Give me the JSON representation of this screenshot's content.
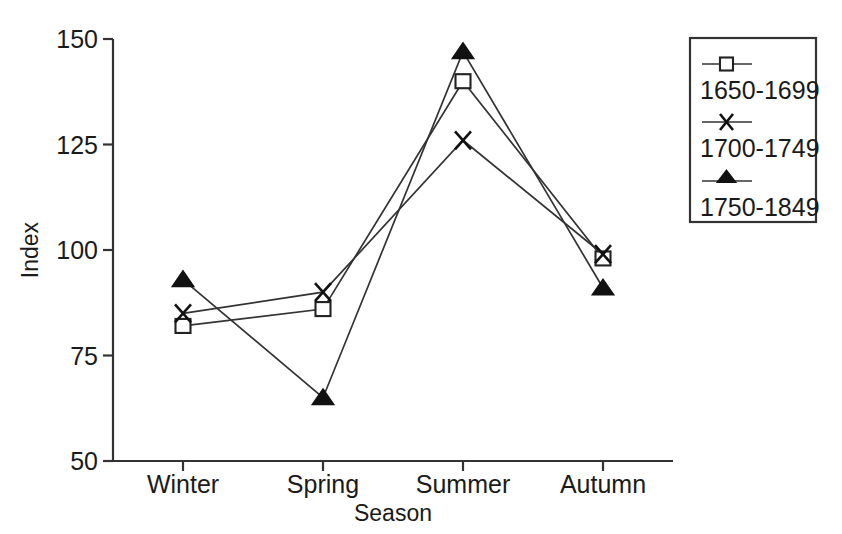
{
  "chart_data": {
    "type": "line",
    "title": "",
    "xlabel": "Season",
    "ylabel": "Index",
    "categories": [
      "Winter",
      "Spring",
      "Summer",
      "Autumn"
    ],
    "ylim": [
      50,
      150
    ],
    "yticks": [
      50,
      75,
      100,
      125,
      150
    ],
    "ytick_labels": [
      "50",
      "75",
      "100",
      "125",
      "150"
    ],
    "grid": false,
    "legend_position": "right-outside",
    "series": [
      {
        "name": "1650-1699",
        "marker": "open-square",
        "values": [
          82,
          86,
          140,
          98
        ]
      },
      {
        "name": "1700-1749",
        "marker": "x-cross",
        "values": [
          85,
          90,
          126,
          99
        ]
      },
      {
        "name": "1750-1849",
        "marker": "filled-triangle",
        "values": [
          93,
          65,
          147,
          91
        ]
      }
    ],
    "colors": {
      "axis": "#333333",
      "line": "#333333",
      "marker_fill": "#111111",
      "marker_open_fill": "#ffffff",
      "background": "#ffffff"
    }
  }
}
